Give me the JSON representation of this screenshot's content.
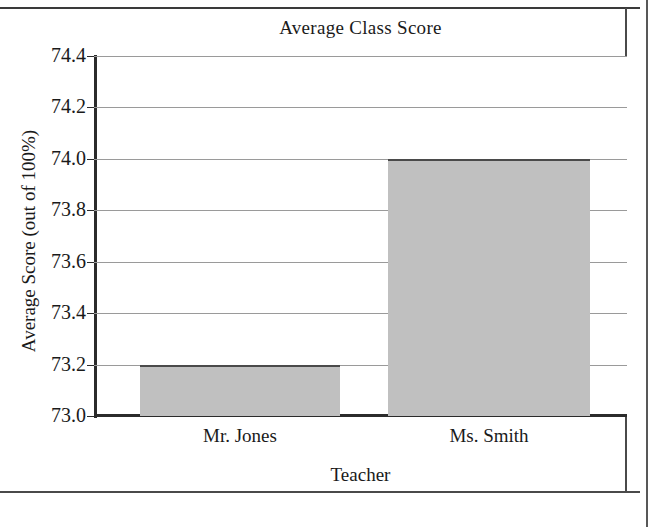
{
  "chart_data": {
    "type": "bar",
    "title": "Average Class Score",
    "xlabel": "Teacher",
    "ylabel": "Average Score (out of 100%)",
    "categories": [
      "Mr. Jones",
      "Ms. Smith"
    ],
    "values": [
      73.2,
      74.0
    ],
    "ylim": [
      73.0,
      74.4
    ],
    "yticks": [
      "73.0",
      "73.2",
      "73.4",
      "73.6",
      "73.8",
      "74.0",
      "74.2",
      "74.4"
    ],
    "ytick_values": [
      73.0,
      73.2,
      73.4,
      73.6,
      73.8,
      74.0,
      74.2,
      74.4
    ],
    "grid": "horizontal",
    "legend": "none",
    "series": [
      {
        "name": "Average Class Score",
        "values": [
          73.2,
          74.0
        ],
        "color": "#c0c0c0"
      }
    ]
  },
  "colors": {
    "bar_fill": "#c0c0c0",
    "bar_edge": "#4a4a4a",
    "axis": "#2b2b2b",
    "gridline": "#9a9a9a",
    "background": "#ffffff",
    "text": "#1a1a1a"
  }
}
